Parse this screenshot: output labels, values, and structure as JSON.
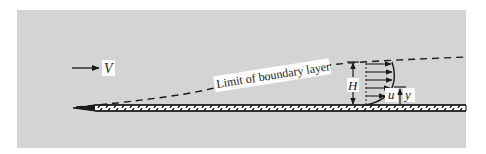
{
  "figure": {
    "background_color": "#d4d4d4",
    "ink_color": "#1a1a1a",
    "labels": {
      "freestream_velocity": "V",
      "boundary_layer_limit": "Limit of boundary layer",
      "thickness": "H",
      "local_velocity": "u",
      "height_coordinate": "y"
    }
  }
}
